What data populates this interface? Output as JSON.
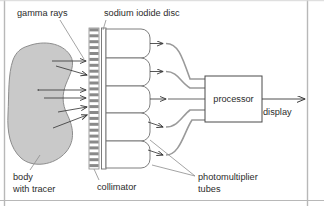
{
  "diagram": {
    "labels": {
      "gamma_rays": "gamma rays",
      "sodium_iodide_disc": "sodium iodide disc",
      "body_line1": "body",
      "body_line2": "with tracer",
      "collimator": "collimator",
      "photomultiplier_line1": "photomultiplier",
      "photomultiplier_line2": "tubes",
      "processor": "processor",
      "display": "display"
    },
    "colors": {
      "body_fill": "#c9c9c9",
      "body_stroke": "#8d8d8d",
      "collimator_dark": "#8a8a8a",
      "collimator_light": "#ffffff",
      "line": "#3a3a3a",
      "signal_line": "#9a9a9a",
      "border": "#b8b8b8",
      "text": "#2b2b2b",
      "background": "#ffffff"
    },
    "counts": {
      "photomultiplier_tubes": 5,
      "collimator_stripes": 24,
      "gamma_ray_arrows": 6
    }
  }
}
